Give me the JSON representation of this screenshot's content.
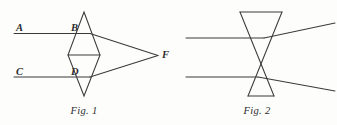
{
  "page": {
    "background_color": "#fdfdfc",
    "ink_color": "#3a3a3c",
    "width": 337,
    "height": 125
  },
  "figures": [
    {
      "id": "fig-1",
      "caption": "Fig. 1",
      "caption_x": 84,
      "caption_y": 114,
      "lens_type": "biconvex-converging",
      "description": "Two parallel incident rays A and C strike a converging (biconvex) lens drawn as a vertical rhombus and meet at focal point F on the right.",
      "labels": [
        {
          "name": "ray-label-a",
          "text": "A",
          "x": 16,
          "y": 31
        },
        {
          "name": "vertex-label-b",
          "text": "B",
          "x": 71,
          "y": 31
        },
        {
          "name": "ray-label-c",
          "text": "C",
          "x": 16,
          "y": 75
        },
        {
          "name": "vertex-label-d",
          "text": "D",
          "x": 71,
          "y": 75
        },
        {
          "name": "focal-point-label-f",
          "text": "F",
          "x": 162,
          "y": 58
        }
      ],
      "lens_outline": "M 84 12 L 100 55 L 84 96 L 68 55 Z",
      "lens_mid_line": {
        "x1": 68,
        "y1": 55,
        "x2": 100,
        "y2": 55
      },
      "incident_rays": [
        {
          "name": "incident-ray-a",
          "x1": 14,
          "y1": 33.5,
          "x2": 90,
          "y2": 33.5
        },
        {
          "name": "incident-ray-c",
          "x1": 14,
          "y1": 77.0,
          "x2": 90,
          "y2": 77.0
        }
      ],
      "refracted_rays": [
        {
          "name": "refracted-ray-a-to-f",
          "x1": 90,
          "y1": 33.5,
          "x2": 158,
          "y2": 55.5
        },
        {
          "name": "refracted-ray-c-to-f",
          "x1": 90,
          "y1": 77.0,
          "x2": 158,
          "y2": 55.5
        }
      ]
    },
    {
      "id": "fig-2",
      "caption": "Fig. 2",
      "caption_x": 257,
      "caption_y": 114,
      "lens_type": "biconcave-diverging",
      "description": "Two parallel incident rays strike a diverging (biconcave) lens drawn as an hourglass and spread apart after passing through.",
      "labels": [],
      "lens_outline": "M 240 12 L 282 12 L 248 96 L 274 96 Z",
      "lens_edges": [
        {
          "name": "lens-top-edge",
          "x1": 240,
          "y1": 12,
          "x2": 282,
          "y2": 12
        },
        {
          "name": "lens-bottom-edge",
          "x1": 248,
          "y1": 96,
          "x2": 274,
          "y2": 96
        },
        {
          "name": "lens-left-diagonal",
          "x1": 240,
          "y1": 12,
          "x2": 274,
          "y2": 96
        },
        {
          "name": "lens-right-diagonal",
          "x1": 282,
          "y1": 12,
          "x2": 248,
          "y2": 96
        }
      ],
      "incident_rays": [
        {
          "name": "incident-ray-upper",
          "x1": 186,
          "y1": 38.0,
          "x2": 264,
          "y2": 38.0
        },
        {
          "name": "incident-ray-lower",
          "x1": 186,
          "y1": 77.0,
          "x2": 258,
          "y2": 77.0
        }
      ],
      "refracted_rays": [
        {
          "name": "diverged-ray-upper",
          "x1": 264,
          "y1": 38.0,
          "x2": 335,
          "y2": 23.0
        },
        {
          "name": "diverged-ray-lower",
          "x1": 258,
          "y1": 77.0,
          "x2": 335,
          "y2": 91.0
        }
      ]
    }
  ]
}
